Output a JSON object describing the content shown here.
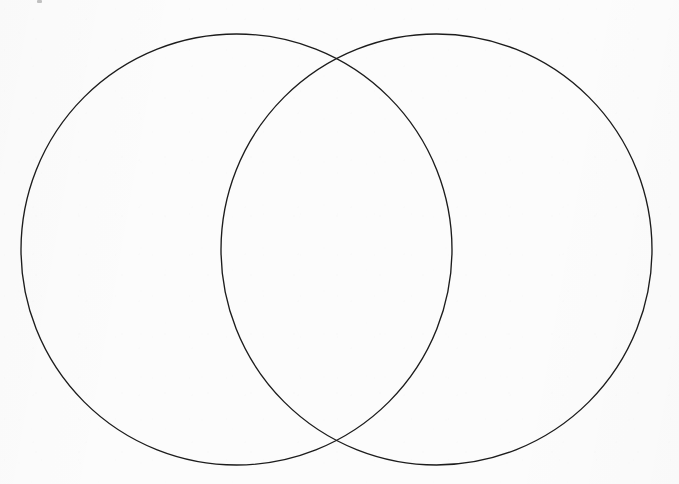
{
  "figure": {
    "kind": "venn-diagram",
    "title": "",
    "caption": "",
    "background_color": "#fcfcfc",
    "stroke_color": "#1c1c1c",
    "stroke_width": 1.35,
    "width": 679,
    "height": 484
  },
  "diagram": {
    "set_count": 2,
    "labels": {
      "left_set": "",
      "right_set": "",
      "intersection": "",
      "outside": ""
    },
    "circles": [
      {
        "id": "left-set-circle",
        "name": "left-set",
        "label": "",
        "cx": 236.5,
        "cy": 249.5,
        "r": 215.5,
        "fill": "none",
        "stroke": "#1c1c1c"
      },
      {
        "id": "right-set-circle",
        "name": "right-set",
        "label": "",
        "cx": 436.5,
        "cy": 249.5,
        "r": 215.5,
        "fill": "none",
        "stroke": "#1c1c1c"
      }
    ],
    "intersection_points": [
      {
        "x": 339,
        "y": 63
      },
      {
        "x": 339,
        "y": 434
      }
    ],
    "regions": [
      {
        "id": "left-only",
        "label": "",
        "content": ""
      },
      {
        "id": "overlap",
        "label": "",
        "content": ""
      },
      {
        "id": "right-only",
        "label": "",
        "content": ""
      }
    ]
  },
  "artifacts": {
    "corner_speck": {
      "x": 37,
      "y": 0,
      "visible": true
    }
  }
}
